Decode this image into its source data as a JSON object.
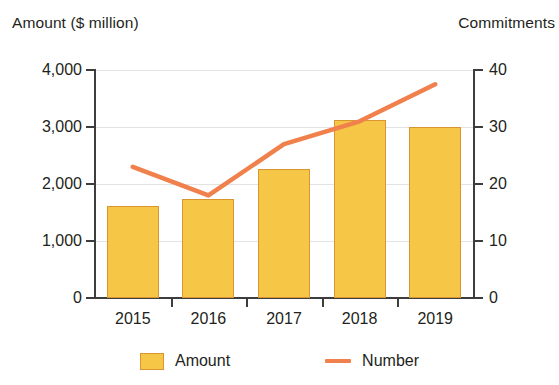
{
  "chart_data": {
    "type": "bar",
    "title": "",
    "categories": [
      "2015",
      "2016",
      "2017",
      "2018",
      "2019"
    ],
    "series": [
      {
        "name": "Amount",
        "type": "bar",
        "axis": "left",
        "values": [
          1620,
          1740,
          2270,
          3120,
          3000
        ],
        "color": "#F6C646"
      },
      {
        "name": "Number",
        "type": "line",
        "axis": "right",
        "values": [
          23,
          18,
          27,
          31,
          37.5
        ],
        "color": "#F0804C"
      }
    ],
    "xlabel": "",
    "ylabel": "Amount ($ million)",
    "y2label": "Commitments",
    "ylim": [
      0,
      4000
    ],
    "y2lim": [
      0,
      40
    ],
    "yticks": [
      "0",
      "1,000",
      "2,000",
      "3,000",
      "4,000"
    ],
    "ytick_values": [
      0,
      1000,
      2000,
      3000,
      4000
    ],
    "y2ticks": [
      "0",
      "10",
      "20",
      "30",
      "40"
    ],
    "y2tick_values": [
      0,
      10,
      20,
      30,
      40
    ],
    "grid": true,
    "legend_position": "bottom",
    "legend": [
      "Amount",
      "Number"
    ]
  },
  "axes": {
    "left_title": "Amount ($ million)",
    "right_title": "Commitments"
  },
  "legend": {
    "amount_label": "Amount",
    "number_label": "Number"
  }
}
